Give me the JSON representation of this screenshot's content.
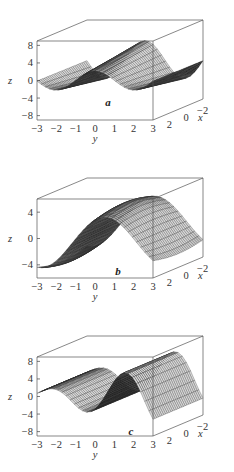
{
  "figure": {
    "panels": [
      {
        "label": "a",
        "z_axis_label": "z",
        "y_axis_label": "y",
        "x_axis_label": "x"
      },
      {
        "label": "b",
        "z_axis_label": "z",
        "y_axis_label": "y",
        "x_axis_label": "x"
      },
      {
        "label": "c",
        "z_axis_label": "z",
        "y_axis_label": "y",
        "x_axis_label": "x"
      }
    ]
  },
  "chart_data": [
    {
      "type": "surface",
      "title": "a",
      "xlabel": "x",
      "ylabel": "y",
      "zlabel": "z",
      "x_ticks": [
        "2",
        "0",
        "−2"
      ],
      "y_ticks": [
        "−3",
        "−2",
        "−1",
        "0",
        "1",
        "2",
        "3"
      ],
      "z_ticks": [
        "−8",
        "−4",
        "0",
        "4",
        "8"
      ],
      "xlim": [
        -3,
        3
      ],
      "ylim": [
        -3,
        3
      ],
      "zlim": [
        -9,
        9
      ],
      "grid": false,
      "description": "Surface with two peaks along y (near y=0 and y=2) and troughs at y=-3, y=-1 and y=3; amplitude grows toward the back"
    },
    {
      "type": "surface",
      "title": "b",
      "xlabel": "x",
      "ylabel": "y",
      "zlabel": "z",
      "x_ticks": [
        "2",
        "0",
        "−2"
      ],
      "y_ticks": [
        "−3",
        "−2",
        "−1",
        "0",
        "1",
        "2",
        "3"
      ],
      "z_ticks": [
        "−4",
        "0",
        "4"
      ],
      "xlim": [
        -3,
        3
      ],
      "ylim": [
        -3,
        3
      ],
      "zlim": [
        -6,
        6
      ],
      "grid": false,
      "description": "Single broad ridge peaking near y=0.5 with troughs near y=-2 and y=2.5"
    },
    {
      "type": "surface",
      "title": "c",
      "xlabel": "x",
      "ylabel": "y",
      "zlabel": "z",
      "x_ticks": [
        "2",
        "0",
        "−2"
      ],
      "y_ticks": [
        "−3",
        "−2",
        "−1",
        "0",
        "1",
        "2",
        "3"
      ],
      "z_ticks": [
        "−8",
        "−4",
        "0",
        "4",
        "8"
      ],
      "xlim": [
        -3,
        3
      ],
      "ylim": [
        -3,
        3
      ],
      "zlim": [
        -9,
        9
      ],
      "grid": false,
      "description": "Oscillating surface with growing amplitude along y: trough near y=-1.5, peak near y=1, larger peak near y=3"
    }
  ]
}
